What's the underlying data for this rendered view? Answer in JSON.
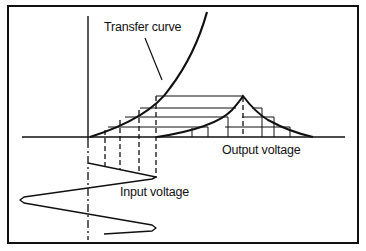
{
  "labels": {
    "transfer_curve": "Transfer curve",
    "output_voltage": "Output voltage",
    "input_voltage": "Input voltage"
  },
  "colors": {
    "ink": "#111111",
    "background": "#ffffff"
  }
}
